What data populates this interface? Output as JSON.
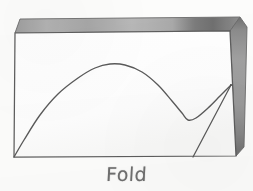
{
  "figure": {
    "caption": "Fold",
    "background_color": "#fcfcfb",
    "paper_color": "#ffffff",
    "ink_color": "#5a5a5a",
    "fold_band_color": "#9a9a9a",
    "fold_band_dark_color": "#6f6f6f",
    "fold_band_light_color": "#b4b4b4"
  },
  "paper": {
    "name": "paper-sheet",
    "corners": {
      "top_left": [
        15,
        33
      ],
      "top_right": [
        230,
        31
      ],
      "bottom_right": [
        236,
        156
      ],
      "bottom_left": [
        14,
        157
      ]
    }
  },
  "folds": {
    "top_band": {
      "name": "top-fold-band",
      "label": "top folded edge",
      "points": "20,19 240,17 230,31 15,33"
    },
    "right_band": {
      "name": "right-fold-band",
      "label": "right folded edge",
      "points": "240,17 247,26 244,146 236,156 230,31"
    }
  },
  "chart_data": {
    "type": "line",
    "title": "Fold",
    "xlabel": "",
    "ylabel": "",
    "grid": false,
    "legend": null,
    "xlim": [
      0,
      220
    ],
    "ylim": [
      0,
      125
    ],
    "series": [
      {
        "name": "fold-curve",
        "label": "folded sheet profile curve",
        "description": "rises from bottom-left corner, crests near x=110, dips to a local minimum near x=188, then rises to the fold point on the right edge",
        "x": [
          14,
          24,
          40,
          58,
          78,
          95,
          110,
          125,
          142,
          158,
          172,
          182,
          188,
          196,
          208,
          220,
          231
        ],
        "y": [
          157,
          140,
          115,
          94,
          78,
          68,
          64,
          65,
          72,
          85,
          101,
          113,
          120,
          118,
          108,
          96,
          85
        ],
        "key_points": {
          "start": [
            14,
            157
          ],
          "peak": [
            110,
            64
          ],
          "local_minimum": [
            188,
            120
          ],
          "end": [
            231,
            85
          ]
        }
      },
      {
        "name": "fold-line",
        "label": "straight fold crease line",
        "description": "straight segment from the bottom edge up to the same right-edge fold point",
        "x": [
          193,
          231
        ],
        "y": [
          157,
          85
        ],
        "key_points": {
          "start": [
            193,
            157
          ],
          "end": [
            231,
            85
          ]
        }
      }
    ],
    "annotations": [
      {
        "name": "fold-label",
        "text": "Fold",
        "x": 124,
        "y": 175
      }
    ]
  }
}
